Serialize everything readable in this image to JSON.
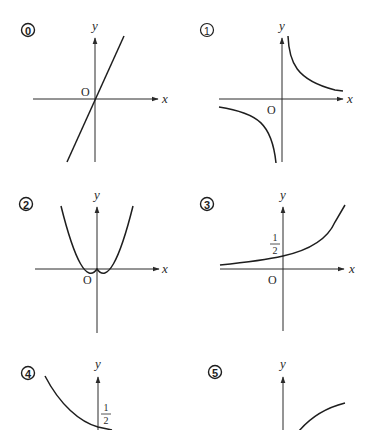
{
  "graphs": [
    {
      "id": "0",
      "label": "0",
      "kind": "line",
      "description": "straight line through origin, positive slope",
      "origin": "O",
      "x_axis": "x",
      "y_axis": "y"
    },
    {
      "id": "1",
      "label": "1",
      "kind": "hyperbola",
      "description": "reciprocal curve in quadrants I and III",
      "origin": "O",
      "x_axis": "x",
      "y_axis": "y"
    },
    {
      "id": "2",
      "label": "2",
      "kind": "parabola",
      "description": "upward parabola with vertex at origin",
      "origin": "O",
      "x_axis": "x",
      "y_axis": "y"
    },
    {
      "id": "3",
      "label": "3",
      "kind": "exponential",
      "description": "increasing exponential with y-intercept 1/2",
      "origin": "O",
      "x_axis": "x",
      "y_axis": "y",
      "intercept_num": "1",
      "intercept_den": "2"
    },
    {
      "id": "4",
      "label": "4",
      "kind": "exponential-decreasing",
      "description": "decreasing curve reaching y-intercept 1/2",
      "y_axis": "y",
      "intercept_num": "1",
      "intercept_den": "2"
    },
    {
      "id": "5",
      "label": "5",
      "kind": "logarithmic",
      "description": "increasing concave curve to the right of the y-axis",
      "y_axis": "y"
    }
  ]
}
